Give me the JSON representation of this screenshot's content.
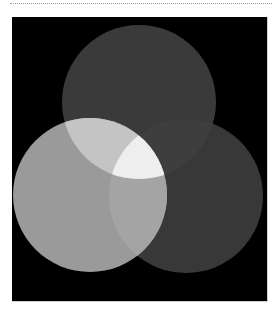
{
  "figure": {
    "type": "venn-diagram",
    "sets": 3,
    "background": "#000000",
    "circles": [
      {
        "id": "top",
        "cx": 139,
        "cy": 102,
        "r": 77,
        "fill": "#3a3a3a"
      },
      {
        "id": "left",
        "cx": 90,
        "cy": 195,
        "r": 77,
        "fill": "#9a9a9a"
      },
      {
        "id": "right",
        "cx": 186,
        "cy": 196,
        "r": 77,
        "fill": "#383838"
      }
    ],
    "intersections": {
      "top_left": "#c4c4c4",
      "top_right": "#3e3e3e",
      "left_right": "#a4a4a4",
      "all_three": "#eeeeee"
    }
  }
}
